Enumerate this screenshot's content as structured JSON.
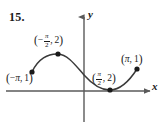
{
  "figure": {
    "problem_number": "15.",
    "axes": {
      "x_label": "x",
      "y_label": "y",
      "x_axis_y_px": 91,
      "y_axis_x_px": 84
    },
    "curve": {
      "description": "sine-like curve from (-pi, 1) rising to local max at (-pi/2, 2), crossing downward through origin region to local min at (pi/2, 2) on the x-axis, then rising to (pi, 1)",
      "stroke_color": "#3a3a3a"
    },
    "points": [
      {
        "id": "left-endpoint",
        "label_text": "(−π, 1)",
        "x_coord": "-π",
        "y_coord": "1",
        "px": 32,
        "py": 72
      },
      {
        "id": "local-max",
        "label_text": "(−π/2, 2)",
        "x_coord": "-π/2",
        "y_coord": "2",
        "px": 58,
        "py": 54
      },
      {
        "id": "local-min",
        "label_text": "(π/2, 2)",
        "x_coord": "π/2",
        "y_coord": "2",
        "px": 110,
        "py": 90
      },
      {
        "id": "right-endpoint",
        "label_text": "(π, 1)",
        "x_coord": "π",
        "y_coord": "1",
        "px": 137,
        "py": 69
      }
    ],
    "math": {
      "open_paren": "(",
      "close_paren": ")",
      "minus": "−",
      "pi": "π",
      "two": "2",
      "one": "1",
      "comma": ","
    },
    "colors": {
      "axis": "#5a5a5a",
      "curve": "#3a3a3a",
      "dot": "#1a1a1a",
      "text": "#1a1a1a",
      "background": "#ffffff"
    }
  }
}
